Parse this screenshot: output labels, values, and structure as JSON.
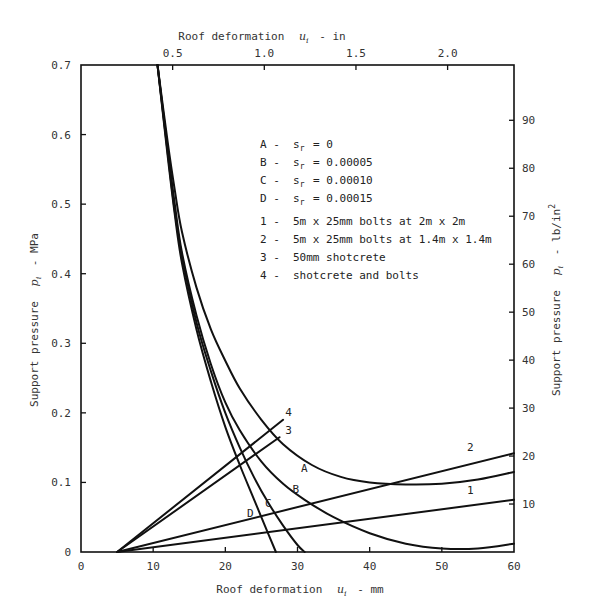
{
  "chart_data": {
    "type": "line",
    "title": "",
    "xlabel": "Roof deformation u_i - mm",
    "x2label": "Roof deformation u_i - in",
    "ylabel": "Support pressure p_i - MPa",
    "y2label": "Support pressure p_i - lb/in2",
    "xlim": [
      0,
      60
    ],
    "ylim": [
      0,
      0.7
    ],
    "x2lim_in": [
      0,
      2.362
    ],
    "y2lim_psi": [
      0,
      101.5
    ],
    "grid": false,
    "legend_position": "inside-upper-center",
    "x_ticks": [
      "0",
      "10",
      "20",
      "30",
      "40",
      "50",
      "60"
    ],
    "y_ticks": [
      "0",
      "0.1",
      "0.2",
      "0.3",
      "0.4",
      "0.5",
      "0.6",
      "0.7"
    ],
    "x2_ticks": [
      "0.5",
      "1.0",
      "1.5",
      "2.0"
    ],
    "y2_ticks": [
      "10",
      "20",
      "30",
      "40",
      "50",
      "60",
      "70",
      "80",
      "90"
    ],
    "legend": [
      {
        "key": "A -",
        "text": "s_r = 0"
      },
      {
        "key": "B -",
        "text": "s_r = 0.00005"
      },
      {
        "key": "C -",
        "text": "s_r = 0.00010"
      },
      {
        "key": "D -",
        "text": "s_r = 0.00015"
      },
      {
        "key": "1 -",
        "text": "5m x 25mm bolts at 2m x 2m"
      },
      {
        "key": "2 -",
        "text": "5m x 25mm bolts at 1.4m x 1.4m"
      },
      {
        "key": "3 -",
        "text": "50mm shotcrete"
      },
      {
        "key": "4 -",
        "text": "shotcrete and bolts"
      }
    ],
    "series": [
      {
        "name": "A",
        "kind": "ground reaction",
        "x": [
          10.6,
          12,
          13,
          14,
          16,
          18,
          20,
          22,
          25,
          28,
          32,
          36,
          40,
          45,
          50,
          55,
          60
        ],
        "y": [
          0.7,
          0.59,
          0.52,
          0.46,
          0.38,
          0.32,
          0.275,
          0.235,
          0.19,
          0.155,
          0.125,
          0.108,
          0.1,
          0.097,
          0.098,
          0.104,
          0.115
        ]
      },
      {
        "name": "B",
        "kind": "ground reaction",
        "x": [
          10.6,
          12,
          13,
          14,
          16,
          18,
          20,
          22,
          25,
          28,
          31,
          35,
          40,
          45,
          50,
          55,
          60
        ],
        "y": [
          0.7,
          0.58,
          0.5,
          0.43,
          0.34,
          0.27,
          0.215,
          0.175,
          0.13,
          0.098,
          0.075,
          0.05,
          0.027,
          0.012,
          0.005,
          0.005,
          0.012
        ]
      },
      {
        "name": "C",
        "kind": "ground reaction",
        "x": [
          10.6,
          12,
          13,
          14,
          16,
          18,
          20,
          22,
          24,
          26,
          28,
          30,
          31
        ],
        "y": [
          0.7,
          0.575,
          0.49,
          0.425,
          0.33,
          0.26,
          0.2,
          0.15,
          0.107,
          0.07,
          0.038,
          0.01,
          0.0
        ]
      },
      {
        "name": "D",
        "kind": "ground reaction",
        "x": [
          10.6,
          12,
          13,
          14,
          16,
          18,
          20,
          22,
          24,
          26,
          27
        ],
        "y": [
          0.7,
          0.57,
          0.485,
          0.415,
          0.32,
          0.245,
          0.18,
          0.125,
          0.075,
          0.025,
          0.0
        ]
      },
      {
        "name": "1",
        "kind": "support line",
        "x": [
          5,
          60
        ],
        "y": [
          0.0,
          0.075
        ]
      },
      {
        "name": "2",
        "kind": "support line",
        "x": [
          5,
          60
        ],
        "y": [
          0.0,
          0.142
        ]
      },
      {
        "name": "3",
        "kind": "support line",
        "x": [
          5,
          27.5
        ],
        "y": [
          0.0,
          0.165
        ]
      },
      {
        "name": "4",
        "kind": "support line",
        "x": [
          5,
          28
        ],
        "y": [
          0.0,
          0.19
        ]
      }
    ],
    "curve_labels": [
      {
        "text": "A",
        "x": 30.5,
        "y": 0.115
      },
      {
        "text": "B",
        "x": 29.3,
        "y": 0.085
      },
      {
        "text": "C",
        "x": 25.5,
        "y": 0.065
      },
      {
        "text": "D",
        "x": 23.0,
        "y": 0.05
      },
      {
        "text": "1",
        "x": 53.5,
        "y": 0.083
      },
      {
        "text": "2",
        "x": 53.5,
        "y": 0.145
      },
      {
        "text": "3",
        "x": 28.3,
        "y": 0.17
      },
      {
        "text": "4",
        "x": 28.3,
        "y": 0.195
      }
    ]
  },
  "labels": {
    "x_title_main": "Roof deformation",
    "x_title_var": "u",
    "x_title_sub": "i",
    "x_title_unit": "- mm",
    "x2_title_main": "Roof deformation",
    "x2_title_unit": "- in",
    "y_title_main": "Support pressure",
    "y_title_var": "p",
    "y_title_sub": "i",
    "y_title_unit": "- MPa",
    "y2_title_unit": "- lb/in",
    "y2_title_sup": "2"
  }
}
